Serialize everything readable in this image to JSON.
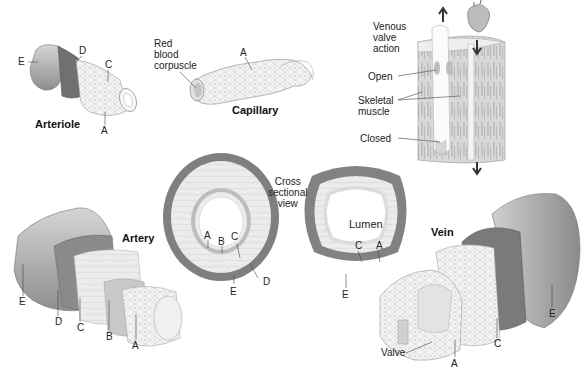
{
  "titles": {
    "arteriole": "Arteriole",
    "capillary": "Capillary",
    "artery": "Artery",
    "vein": "Vein"
  },
  "arteriole_labels": {
    "E": "E",
    "D": "D",
    "C": "C",
    "A": "A"
  },
  "capillary_labels": {
    "red_blood_corpuscle": "Red\nblood\ncorpuscle",
    "A": "A"
  },
  "venous_valve": {
    "title": "Venous\nvalve\naction",
    "open": "Open",
    "skeletal_muscle": "Skeletal\nmuscle",
    "closed": "Closed"
  },
  "cross_section": {
    "title": "Cross\nsectional\nview",
    "artery_labels": {
      "A": "A",
      "B": "B",
      "C": "C",
      "D": "D",
      "E": "E"
    },
    "vein_labels": {
      "lumen": "Lumen",
      "C": "C",
      "A": "A",
      "E": "E"
    }
  },
  "artery_labels": {
    "E": "E",
    "D": "D",
    "C": "C",
    "B": "B",
    "A": "A"
  },
  "vein_labels": {
    "valve": "Valve",
    "A": "A",
    "C": "C",
    "E": "E"
  },
  "colors": {
    "dark_layer": "#7d7d7d",
    "mid_layer": "#b5b5b5",
    "light_layer": "#e8e8e8",
    "cell_line": "#c9c9c9",
    "leader": "#444444"
  }
}
